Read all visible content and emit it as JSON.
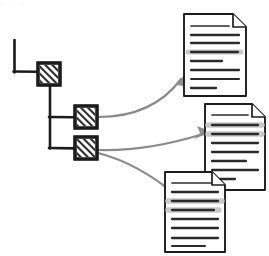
{
  "figure": {
    "caption_fragment": "",
    "background_color": "#ffffff"
  },
  "style": {
    "ink_color": "#1c1c1c",
    "arrow_color": "#8b8b8b",
    "hatch_color": "#2a2a2a",
    "highlight_color": "#c9c9c9",
    "doc_line_color": "#2b2b2b",
    "doc_fill": "#ffffff"
  },
  "tree": {
    "root_connector": {
      "name": "L-shaped root stub",
      "vertical": {
        "x": 14,
        "y1": 40,
        "y2": 72
      },
      "horizontal": {
        "y": 72,
        "x1": 14,
        "x2": 38
      }
    },
    "branch_connector": {
      "name": "vertical spine with two L branches",
      "spine": {
        "x": 50,
        "y1": 88,
        "y2": 148
      },
      "branches": [
        {
          "y": 117,
          "x1": 50,
          "x2": 75
        },
        {
          "y": 148,
          "x1": 50,
          "x2": 75
        }
      ]
    },
    "nodes": [
      {
        "id": "node-1",
        "label": "hatched node 1",
        "level": 0,
        "x": 38,
        "y": 63,
        "w": 22,
        "h": 22,
        "fill": "hatch"
      },
      {
        "id": "node-2",
        "label": "hatched node 2",
        "level": 1,
        "x": 75,
        "y": 106,
        "w": 22,
        "h": 22,
        "fill": "hatch"
      },
      {
        "id": "node-3",
        "label": "hatched node 3",
        "level": 1,
        "x": 75,
        "y": 137,
        "w": 22,
        "h": 22,
        "fill": "hatch"
      }
    ]
  },
  "documents": [
    {
      "id": "doc-top",
      "label": "document top",
      "x": 184,
      "y": 14,
      "w": 62,
      "h": 82,
      "fold": 13,
      "lines": [
        {
          "x1": 0.11,
          "x2": 0.72,
          "y": 0.14,
          "weight": 1.6,
          "highlight": false
        },
        {
          "x1": 0.11,
          "x2": 0.88,
          "y": 0.25,
          "weight": 2.1,
          "highlight": false
        },
        {
          "x1": 0.11,
          "x2": 0.88,
          "y": 0.35,
          "weight": 2.1,
          "highlight": false
        },
        {
          "x1": 0.08,
          "x2": 0.92,
          "y": 0.455,
          "weight": 2.4,
          "highlight": true
        },
        {
          "x1": 0.11,
          "x2": 0.62,
          "y": 0.56,
          "weight": 2.1,
          "highlight": false
        },
        {
          "x1": 0.11,
          "x2": 0.88,
          "y": 0.665,
          "weight": 2.1,
          "highlight": false
        },
        {
          "x1": 0.11,
          "x2": 0.88,
          "y": 0.775,
          "weight": 1.8,
          "highlight": false
        },
        {
          "x1": 0.11,
          "x2": 0.52,
          "y": 0.875,
          "weight": 2.1,
          "highlight": false
        }
      ]
    },
    {
      "id": "doc-middle",
      "label": "document middle",
      "x": 205,
      "y": 104,
      "w": 60,
      "h": 86,
      "fold": 13,
      "lines": [
        {
          "x1": 0.11,
          "x2": 0.72,
          "y": 0.13,
          "weight": 1.6,
          "highlight": false
        },
        {
          "x1": 0.06,
          "x2": 0.95,
          "y": 0.245,
          "weight": 2.4,
          "highlight": true
        },
        {
          "x1": 0.06,
          "x2": 0.95,
          "y": 0.345,
          "weight": 2.4,
          "highlight": true
        },
        {
          "x1": 0.11,
          "x2": 0.88,
          "y": 0.45,
          "weight": 2.1,
          "highlight": false
        },
        {
          "x1": 0.11,
          "x2": 0.88,
          "y": 0.555,
          "weight": 2.1,
          "highlight": false
        },
        {
          "x1": 0.11,
          "x2": 0.72,
          "y": 0.655,
          "weight": 2.1,
          "highlight": false
        },
        {
          "x1": 0.11,
          "x2": 0.88,
          "y": 0.755,
          "weight": 2.1,
          "highlight": false
        },
        {
          "x1": 0.11,
          "x2": 0.45,
          "y": 0.855,
          "weight": 2.1,
          "highlight": false
        }
      ]
    },
    {
      "id": "doc-bottom",
      "label": "document bottom",
      "x": 165,
      "y": 172,
      "w": 60,
      "h": 80,
      "fold": 13,
      "lines": [
        {
          "x1": 0.11,
          "x2": 0.78,
          "y": 0.14,
          "weight": 1.6,
          "highlight": false
        },
        {
          "x1": 0.11,
          "x2": 0.88,
          "y": 0.255,
          "weight": 2.1,
          "highlight": false
        },
        {
          "x1": 0.06,
          "x2": 0.95,
          "y": 0.365,
          "weight": 2.4,
          "highlight": true
        },
        {
          "x1": 0.06,
          "x2": 0.88,
          "y": 0.465,
          "weight": 2.4,
          "highlight": true
        },
        {
          "x1": 0.11,
          "x2": 0.88,
          "y": 0.575,
          "weight": 2.1,
          "highlight": false
        },
        {
          "x1": 0.11,
          "x2": 0.88,
          "y": 0.685,
          "weight": 2.1,
          "highlight": false
        },
        {
          "x1": 0.11,
          "x2": 0.88,
          "y": 0.8,
          "weight": 2.1,
          "highlight": false
        },
        {
          "x1": 0.11,
          "x2": 0.68,
          "y": 0.9,
          "weight": 1.8,
          "highlight": false
        }
      ]
    }
  ],
  "arrows": [
    {
      "id": "arrow-node2-to-doc-top",
      "label": "arrow from node 2 to top document",
      "from": "node-2",
      "to": "doc-top",
      "path": "M98,117 C130,116 160,105 182,78",
      "head": {
        "x": 184,
        "y": 74,
        "angle": -53
      }
    },
    {
      "id": "arrow-node3-to-doc-middle",
      "label": "arrow from node 3 to middle document",
      "from": "node-3",
      "to": "doc-middle",
      "path": "M98,150 C133,150 170,143 202,134",
      "head": {
        "x": 206,
        "y": 133,
        "angle": -16
      }
    },
    {
      "id": "arrow-node3-to-doc-bottom",
      "label": "arrow from node 3 to bottom document",
      "from": "node-3",
      "to": "doc-bottom",
      "path": "M98,152 C130,160 158,178 178,195",
      "head": {
        "x": 182,
        "y": 198,
        "angle": 40
      }
    }
  ],
  "top_crop_text": "· · · ·"
}
